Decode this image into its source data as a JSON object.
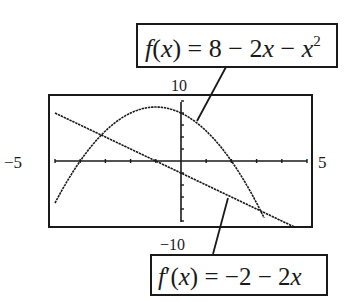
{
  "chart_data": {
    "type": "line",
    "title": "",
    "xlabel": "",
    "ylabel": "",
    "xlim": [
      -5,
      5
    ],
    "ylim": [
      -10,
      10
    ],
    "grid": false,
    "axis_tick_labels": {
      "x_min": "−5",
      "x_max": "5",
      "y_max": "10",
      "y_min": "−10"
    },
    "series": [
      {
        "name": "f(x) = 8 − 2x − x²",
        "kind": "parabola",
        "formula": "8 - 2x - x^2",
        "x": [
          -5,
          -4,
          -3,
          -2,
          -1,
          0,
          1,
          2,
          3,
          3.3
        ],
        "y": [
          -7,
          0,
          5,
          8,
          9,
          8,
          5,
          0,
          -7,
          -9.5
        ]
      },
      {
        "name": "f'(x) = −2 − 2x",
        "kind": "line",
        "formula": "-2 - 2x",
        "x": [
          -5,
          -4,
          -3,
          -2,
          -1,
          0,
          1,
          2,
          3,
          4,
          4.5
        ],
        "y": [
          8,
          6,
          4,
          2,
          0,
          -2,
          -4,
          -6,
          -8,
          -10,
          -11
        ]
      }
    ],
    "annotations": [
      {
        "text": "f(x) = 8 − 2x − x²",
        "points_to": "parabola",
        "position": "top-right callout box"
      },
      {
        "text": "f'(x) = −2 − 2x",
        "points_to": "line",
        "position": "bottom callout box"
      }
    ]
  },
  "labels": {
    "x_min": "−5",
    "x_max": "5",
    "y_max": "10",
    "y_min": "−10"
  },
  "callouts": {
    "top": {
      "f": "f",
      "lparen": "(",
      "x": "x",
      "rparen_eq": ") = 8 − 2",
      "x2": "x",
      "minus": " − ",
      "x3": "x",
      "exp": "2"
    },
    "bottom": {
      "f": "f",
      "prime": "′",
      "lparen": "(",
      "x": "x",
      "rparen_eq": ") = −2 − 2",
      "x2": "x"
    }
  },
  "colors": {
    "ink": "#1a1a1a",
    "background": "#ffffff"
  }
}
